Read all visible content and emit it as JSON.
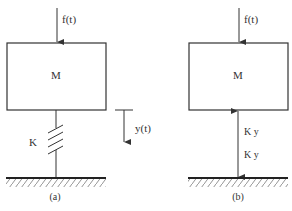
{
  "diagram": {
    "a": {
      "force_label": "f(t)",
      "mass_label": "M",
      "spring_label": "K",
      "displacement_label": "y(t)",
      "caption": "(a)"
    },
    "b": {
      "force_label": "f(t)",
      "mass_label": "M",
      "upper_force_label": "K y",
      "lower_force_label": "K y",
      "caption": "(b)"
    },
    "colors": {
      "line": "#333333",
      "background": "#ffffff"
    }
  }
}
